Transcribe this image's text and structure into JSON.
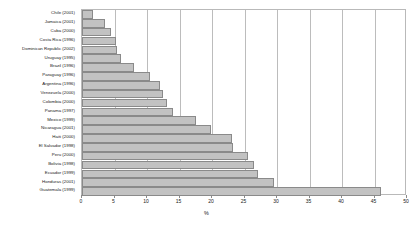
{
  "chart_data": {
    "type": "bar",
    "orientation": "horizontal",
    "title": "",
    "xlabel": "%",
    "ylabel": "",
    "xlim": [
      0,
      50
    ],
    "xticks": [
      0,
      5,
      10,
      15,
      20,
      25,
      30,
      35,
      40,
      45,
      50
    ],
    "grid": true,
    "legend": false,
    "bar_fill_color": "#c2c2c2",
    "bar_border_color": "#8a8a8a",
    "categories": [
      "Chile (2001)",
      "Jamaica (2001)",
      "Cuba (2000)",
      "Costa Rica (1996)",
      "Dominican Republic (2002)",
      "Uruguay (1995)",
      "Brazil (1996)",
      "Paraguay (1996)",
      "Argentina (1996)",
      "Venezuela (2000)",
      "Colombia (2000)",
      "Panama (1997)",
      "Mexico (1999)",
      "Nicaragua (2001)",
      "Haiti (2000)",
      "El Salvador (1998)",
      "Peru (2000)",
      "Bolivia (1998)",
      "Ecuador (1999)",
      "Honduras (2001)",
      "Guatemala (1999)"
    ],
    "values": [
      1.7,
      3.5,
      4.5,
      5.2,
      5.4,
      6.0,
      8.0,
      10.5,
      12.0,
      12.5,
      13.0,
      14.0,
      17.5,
      19.8,
      23.0,
      23.3,
      25.5,
      26.5,
      27.0,
      29.5,
      46.0
    ]
  }
}
